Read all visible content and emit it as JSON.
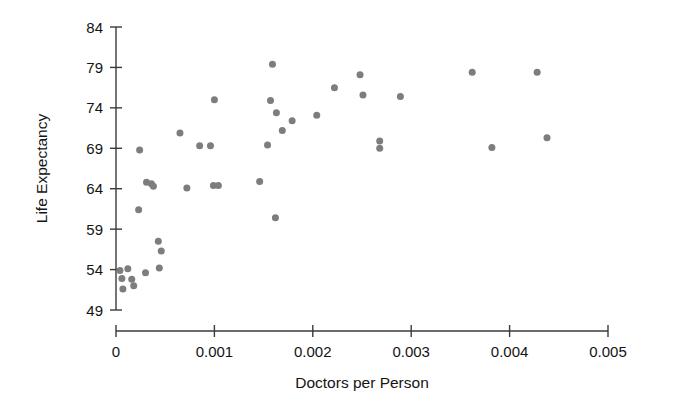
{
  "chart_data": {
    "type": "scatter",
    "title": "",
    "xlabel": "Doctors per Person",
    "ylabel": "Life Expectancy",
    "xlim": [
      0,
      0.005
    ],
    "ylim": [
      49,
      84
    ],
    "xticks": [
      0,
      0.001,
      0.002,
      0.003,
      0.004,
      0.005
    ],
    "xtick_labels": [
      "0",
      "0.001",
      "0.002",
      "0.003",
      "0.004",
      "0.005"
    ],
    "yticks": [
      49,
      54,
      59,
      64,
      69,
      74,
      79,
      84
    ],
    "ytick_labels": [
      "49",
      "54",
      "59",
      "64",
      "69",
      "74",
      "79",
      "84"
    ],
    "grid": false,
    "legend": null,
    "marker": {
      "shape": "circle",
      "color": "#7d7d7d",
      "size": 7
    },
    "points": [
      {
        "x": 4e-05,
        "y": 53.9
      },
      {
        "x": 6e-05,
        "y": 52.9
      },
      {
        "x": 7e-05,
        "y": 51.6
      },
      {
        "x": 0.00012,
        "y": 54.1
      },
      {
        "x": 0.00016,
        "y": 52.8
      },
      {
        "x": 0.00018,
        "y": 52.0
      },
      {
        "x": 0.0003,
        "y": 53.6
      },
      {
        "x": 0.00044,
        "y": 54.2
      },
      {
        "x": 0.00024,
        "y": 68.8
      },
      {
        "x": 0.00031,
        "y": 64.8
      },
      {
        "x": 0.00036,
        "y": 64.6
      },
      {
        "x": 0.00038,
        "y": 64.3
      },
      {
        "x": 0.00023,
        "y": 61.4
      },
      {
        "x": 0.00043,
        "y": 57.5
      },
      {
        "x": 0.00046,
        "y": 56.3
      },
      {
        "x": 0.00065,
        "y": 70.9
      },
      {
        "x": 0.00072,
        "y": 64.1
      },
      {
        "x": 0.00085,
        "y": 69.3
      },
      {
        "x": 0.00096,
        "y": 69.3
      },
      {
        "x": 0.001,
        "y": 75.0
      },
      {
        "x": 0.00099,
        "y": 64.4
      },
      {
        "x": 0.00104,
        "y": 64.4
      },
      {
        "x": 0.00146,
        "y": 64.9
      },
      {
        "x": 0.00159,
        "y": 79.4
      },
      {
        "x": 0.00157,
        "y": 74.9
      },
      {
        "x": 0.00163,
        "y": 73.4
      },
      {
        "x": 0.00154,
        "y": 69.4
      },
      {
        "x": 0.00169,
        "y": 71.2
      },
      {
        "x": 0.00179,
        "y": 72.4
      },
      {
        "x": 0.00162,
        "y": 60.4
      },
      {
        "x": 0.00204,
        "y": 73.1
      },
      {
        "x": 0.00222,
        "y": 76.5
      },
      {
        "x": 0.00248,
        "y": 78.1
      },
      {
        "x": 0.00251,
        "y": 75.6
      },
      {
        "x": 0.00268,
        "y": 69.9
      },
      {
        "x": 0.00268,
        "y": 69.0
      },
      {
        "x": 0.00289,
        "y": 75.4
      },
      {
        "x": 0.00362,
        "y": 78.4
      },
      {
        "x": 0.00382,
        "y": 69.1
      },
      {
        "x": 0.00428,
        "y": 78.4
      },
      {
        "x": 0.00438,
        "y": 70.3
      }
    ]
  }
}
